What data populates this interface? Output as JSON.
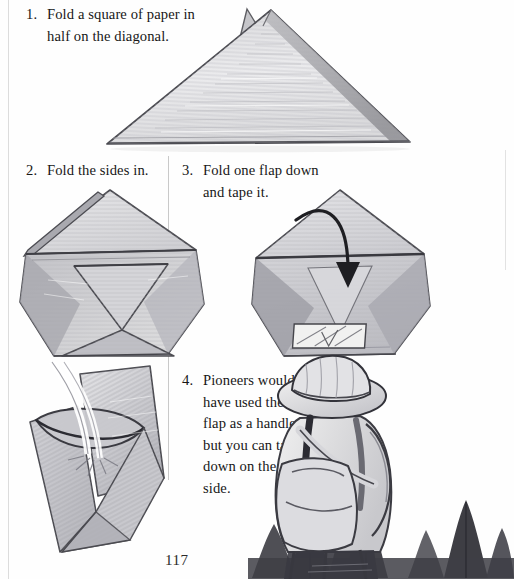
{
  "page": {
    "page_number": "117",
    "background_color": "#fefefe",
    "ink_color": "#1b1b1b",
    "pencil_color": "#8e8e92"
  },
  "steps": [
    {
      "number": "1.",
      "lines": [
        "Fold a square of paper in",
        "half on the diagonal."
      ],
      "illustration": "folded-triangle-sketch"
    },
    {
      "number": "2.",
      "lines": [
        "Fold the sides in."
      ],
      "illustration": "folded-pentagon-sides-in-sketch"
    },
    {
      "number": "3.",
      "lines": [
        "Fold one flap down",
        "and tape it."
      ],
      "illustration": "folded-pentagon-flap-down-arrow-tape-sketch"
    },
    {
      "number": "4.",
      "lines": [
        "Pioneers would",
        "have used the top",
        "flap as a handle,",
        "but you can tape it",
        "down on the other",
        "side."
      ],
      "illustration": "paper-cup-with-water-sketch"
    }
  ],
  "scene": {
    "name": "hiker-with-pine-trees",
    "description": "Pencil sketch of a hiker seen from behind wearing a wide-brimmed hat and a backpack, standing before pine trees."
  }
}
